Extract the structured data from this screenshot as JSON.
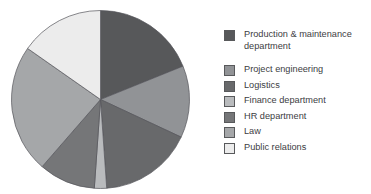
{
  "page": {
    "background": "#ffffff"
  },
  "chart_data": {
    "type": "pie",
    "title": "",
    "legend_position": "right",
    "start_angle_deg": 0,
    "clockwise": true,
    "slice_stroke_color": "#54555a",
    "slice_stroke_width": 0.7,
    "categories": [
      "Production & maintenance department",
      "Project engineering",
      "Logistics",
      "Finance department",
      "HR department",
      "Law",
      "Public relations"
    ],
    "slices": [
      {
        "label": "Production & maintenance department",
        "angle_deg": 68,
        "percent": 18.9,
        "color": "#57585a"
      },
      {
        "label": "Project engineering",
        "angle_deg": 47,
        "percent": 13.1,
        "color": "#919396"
      },
      {
        "label": "Logistics",
        "angle_deg": 61,
        "percent": 16.9,
        "color": "#68696b"
      },
      {
        "label": "Finance department",
        "angle_deg": 8,
        "percent": 2.2,
        "color": "#b9bbbd"
      },
      {
        "label": "HR department",
        "angle_deg": 37,
        "percent": 10.3,
        "color": "#757678"
      },
      {
        "label": "Law",
        "angle_deg": 84,
        "percent": 23.3,
        "color": "#a5a7a9"
      },
      {
        "label": "Public relations",
        "angle_deg": 55,
        "percent": 15.3,
        "color": "#ececec"
      }
    ]
  }
}
